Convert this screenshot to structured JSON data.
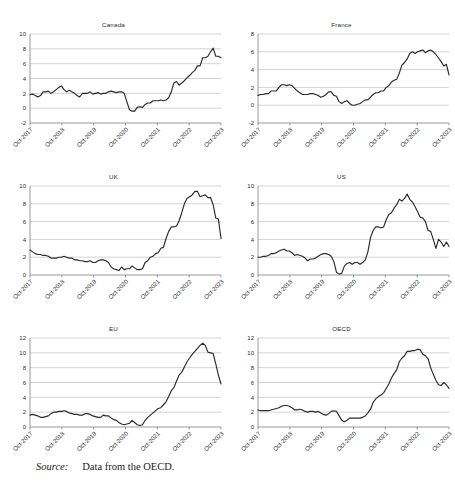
{
  "figure": {
    "source_label": "Source:",
    "source_text": "Data from the OECD."
  },
  "chart_data": [
    {
      "type": "line",
      "title": "Canada",
      "xlabel": "",
      "ylabel": "",
      "grid": true,
      "legend": "none",
      "ylim": [
        -2,
        10
      ],
      "yticks": [
        -2,
        0,
        2,
        4,
        6,
        8,
        10
      ],
      "xticks": [
        "Oct-2017",
        "Oct-2018",
        "Oct-2019",
        "Oct-2020",
        "Oct-2021",
        "Oct-2022",
        "Oct-2023"
      ],
      "x": [
        0,
        1,
        2,
        3,
        4,
        5,
        6,
        7,
        8,
        9,
        10,
        11,
        12,
        13,
        14,
        15,
        16,
        17,
        18,
        19,
        20,
        21,
        22,
        23,
        24,
        25,
        26,
        27,
        28,
        29,
        30,
        31,
        32,
        33,
        34,
        35,
        36,
        37,
        38,
        39,
        40,
        41,
        42,
        43,
        44,
        45,
        46,
        47,
        48,
        49,
        50,
        51,
        52,
        53,
        54,
        55,
        56,
        57,
        58,
        59,
        60,
        61,
        62,
        63,
        64,
        65,
        66,
        67,
        68,
        69,
        70,
        71,
        72,
        73
      ],
      "values": [
        1.8,
        1.9,
        1.7,
        1.5,
        1.7,
        2.2,
        2.2,
        2.3,
        2.0,
        2.2,
        2.5,
        2.8,
        3.0,
        2.5,
        2.2,
        2.4,
        2.2,
        2.0,
        1.7,
        1.5,
        2.0,
        2.0,
        2.0,
        2.2,
        1.9,
        2.0,
        2.1,
        1.9,
        2.0,
        2.0,
        2.2,
        2.3,
        2.2,
        2.1,
        2.2,
        2.2,
        2.0,
        0.9,
        -0.2,
        -0.4,
        -0.4,
        0.1,
        0.2,
        0.1,
        0.5,
        0.7,
        0.7,
        1.0,
        1.0,
        1.0,
        1.1,
        1.0,
        1.1,
        1.4,
        2.2,
        3.4,
        3.6,
        3.1,
        3.4,
        3.7,
        4.1,
        4.4,
        4.8,
        5.1,
        5.7,
        5.7,
        6.8,
        6.8,
        7.0,
        7.6,
        8.1,
        7.0,
        7.0,
        6.8
      ]
    },
    {
      "type": "line",
      "title": "France",
      "xlabel": "",
      "ylabel": "",
      "grid": true,
      "legend": "none",
      "ylim": [
        -2,
        8
      ],
      "yticks": [
        -2,
        0,
        2,
        4,
        6,
        8
      ],
      "xticks": [
        "Oct-2017",
        "Oct-2018",
        "Oct-2019",
        "Oct-2020",
        "Oct-2021",
        "Oct-2022",
        "Oct-2023"
      ],
      "x": [
        0,
        1,
        2,
        3,
        4,
        5,
        6,
        7,
        8,
        9,
        10,
        11,
        12,
        13,
        14,
        15,
        16,
        17,
        18,
        19,
        20,
        21,
        22,
        23,
        24,
        25,
        26,
        27,
        28,
        29,
        30,
        31,
        32,
        33,
        34,
        35,
        36,
        37,
        38,
        39,
        40,
        41,
        42,
        43,
        44,
        45,
        46,
        47,
        48,
        49,
        50,
        51,
        52,
        53,
        54,
        55,
        56,
        57,
        58,
        59,
        60,
        61,
        62,
        63,
        64,
        65,
        66,
        67,
        68,
        69,
        70,
        71,
        72,
        73
      ],
      "values": [
        1.1,
        1.2,
        1.2,
        1.3,
        1.3,
        1.6,
        1.6,
        1.6,
        2.0,
        2.3,
        2.3,
        2.2,
        2.3,
        2.2,
        1.9,
        1.6,
        1.4,
        1.2,
        1.2,
        1.2,
        1.3,
        1.3,
        1.2,
        1.1,
        0.9,
        1.0,
        1.2,
        1.5,
        1.5,
        1.1,
        1.0,
        0.4,
        0.2,
        0.4,
        0.5,
        0.2,
        0.0,
        0.0,
        0.1,
        0.2,
        0.4,
        0.6,
        0.6,
        0.9,
        1.2,
        1.4,
        1.4,
        1.6,
        1.6,
        2.0,
        2.2,
        2.6,
        2.8,
        2.9,
        3.6,
        4.5,
        4.8,
        5.2,
        5.8,
        6.0,
        5.8,
        6.0,
        6.1,
        6.2,
        5.9,
        6.1,
        6.2,
        6.0,
        5.7,
        5.3,
        4.9,
        4.4,
        4.6,
        3.4
      ]
    },
    {
      "type": "line",
      "title": "UK",
      "xlabel": "",
      "ylabel": "",
      "grid": true,
      "legend": "none",
      "ylim": [
        0,
        10
      ],
      "yticks": [
        0,
        2,
        4,
        6,
        8,
        10
      ],
      "xticks": [
        "Oct-2017",
        "Oct-2018",
        "Oct-2019",
        "Oct-2020",
        "Oct-2021",
        "Oct-2022",
        "Oct-2023"
      ],
      "x": [
        0,
        1,
        2,
        3,
        4,
        5,
        6,
        7,
        8,
        9,
        10,
        11,
        12,
        13,
        14,
        15,
        16,
        17,
        18,
        19,
        20,
        21,
        22,
        23,
        24,
        25,
        26,
        27,
        28,
        29,
        30,
        31,
        32,
        33,
        34,
        35,
        36,
        37,
        38,
        39,
        40,
        41,
        42,
        43,
        44,
        45,
        46,
        47,
        48,
        49,
        50,
        51,
        52,
        53,
        54,
        55,
        56,
        57,
        58,
        59,
        60,
        61,
        62,
        63,
        64,
        65,
        66,
        67,
        68,
        69,
        70,
        71,
        72,
        73
      ],
      "values": [
        2.8,
        2.6,
        2.4,
        2.3,
        2.3,
        2.2,
        2.2,
        2.1,
        1.9,
        1.9,
        1.9,
        2.0,
        2.0,
        2.1,
        2.0,
        1.9,
        1.9,
        1.7,
        1.7,
        1.6,
        1.6,
        1.5,
        1.5,
        1.6,
        1.4,
        1.4,
        1.6,
        1.7,
        1.7,
        1.6,
        1.4,
        0.9,
        0.7,
        0.6,
        0.5,
        0.9,
        0.6,
        0.7,
        0.7,
        1.0,
        0.8,
        0.6,
        0.6,
        0.7,
        1.4,
        1.6,
        2.0,
        2.1,
        2.4,
        2.5,
        3.0,
        3.1,
        4.1,
        4.9,
        5.4,
        5.4,
        5.5,
        6.1,
        7.0,
        8.0,
        8.6,
        8.8,
        9.0,
        9.4,
        9.4,
        8.8,
        8.9,
        9.0,
        8.7,
        8.7,
        7.9,
        6.4,
        6.3,
        4.1
      ]
    },
    {
      "type": "line",
      "title": "US",
      "xlabel": "",
      "ylabel": "",
      "grid": true,
      "legend": "none",
      "ylim": [
        0,
        10
      ],
      "yticks": [
        0,
        2,
        4,
        6,
        8,
        10
      ],
      "xticks": [
        "Oct-2017",
        "Oct-2018",
        "Oct-2019",
        "Oct-2020",
        "Oct-2021",
        "Oct-2022",
        "Oct-2023"
      ],
      "x": [
        0,
        1,
        2,
        3,
        4,
        5,
        6,
        7,
        8,
        9,
        10,
        11,
        12,
        13,
        14,
        15,
        16,
        17,
        18,
        19,
        20,
        21,
        22,
        23,
        24,
        25,
        26,
        27,
        28,
        29,
        30,
        31,
        32,
        33,
        34,
        35,
        36,
        37,
        38,
        39,
        40,
        41,
        42,
        43,
        44,
        45,
        46,
        47,
        48,
        49,
        50,
        51,
        52,
        53,
        54,
        55,
        56,
        57,
        58,
        59,
        60,
        61,
        62,
        63,
        64,
        65,
        66,
        67,
        68,
        69,
        70,
        71,
        72,
        73
      ],
      "values": [
        2.0,
        2.0,
        2.1,
        2.1,
        2.2,
        2.4,
        2.4,
        2.5,
        2.7,
        2.8,
        2.9,
        2.7,
        2.7,
        2.5,
        2.2,
        2.3,
        2.2,
        2.1,
        1.9,
        1.6,
        1.8,
        1.8,
        1.9,
        2.1,
        2.3,
        2.4,
        2.4,
        2.3,
        2.1,
        1.5,
        0.3,
        0.1,
        0.2,
        1.0,
        1.3,
        1.4,
        1.2,
        1.4,
        1.4,
        1.2,
        1.4,
        1.7,
        2.6,
        4.2,
        5.0,
        5.4,
        5.4,
        5.3,
        5.4,
        6.2,
        6.8,
        7.0,
        7.5,
        7.9,
        8.5,
        8.3,
        8.6,
        9.1,
        8.5,
        8.2,
        7.7,
        7.1,
        6.5,
        6.4,
        6.0,
        5.0,
        4.9,
        4.0,
        3.0,
        4.0,
        3.7,
        3.2,
        3.7,
        3.2
      ]
    },
    {
      "type": "line",
      "title": "EU",
      "xlabel": "",
      "ylabel": "",
      "grid": true,
      "legend": "none",
      "ylim": [
        0,
        12
      ],
      "yticks": [
        0,
        2,
        4,
        6,
        8,
        10,
        12
      ],
      "xticks": [
        "Oct-2017",
        "Oct-2018",
        "Oct-2019",
        "Oct-2020",
        "Oct-2021",
        "Oct-2022",
        "Oct-2023"
      ],
      "x": [
        0,
        1,
        2,
        3,
        4,
        5,
        6,
        7,
        8,
        9,
        10,
        11,
        12,
        13,
        14,
        15,
        16,
        17,
        18,
        19,
        20,
        21,
        22,
        23,
        24,
        25,
        26,
        27,
        28,
        29,
        30,
        31,
        32,
        33,
        34,
        35,
        36,
        37,
        38,
        39,
        40,
        41,
        42,
        43,
        44,
        45,
        46,
        47,
        48,
        49,
        50,
        51,
        52,
        53,
        54,
        55,
        56,
        57,
        58,
        59,
        60,
        61,
        62,
        63,
        64,
        65,
        66,
        67,
        68,
        69,
        70,
        71,
        72,
        73
      ],
      "values": [
        1.6,
        1.7,
        1.6,
        1.5,
        1.3,
        1.3,
        1.4,
        1.5,
        1.8,
        2.0,
        2.0,
        2.1,
        2.1,
        2.2,
        2.1,
        1.9,
        1.8,
        1.7,
        1.7,
        1.6,
        1.6,
        1.8,
        1.8,
        1.7,
        1.5,
        1.4,
        1.3,
        1.3,
        1.6,
        1.5,
        1.5,
        1.2,
        1.0,
        0.9,
        0.6,
        0.4,
        0.3,
        0.4,
        0.5,
        0.9,
        0.6,
        0.3,
        0.2,
        0.3,
        0.9,
        1.3,
        1.6,
        1.9,
        2.2,
        2.5,
        2.6,
        3.0,
        3.4,
        4.1,
        4.9,
        5.3,
        6.2,
        7.0,
        7.4,
        8.1,
        8.8,
        9.3,
        9.8,
        10.2,
        10.6,
        11.0,
        11.3,
        11.0,
        10.1,
        10.0,
        9.9,
        8.5,
        7.0,
        5.8
      ]
    },
    {
      "type": "line",
      "title": "OECD",
      "xlabel": "",
      "ylabel": "",
      "grid": true,
      "legend": "none",
      "ylim": [
        0,
        12
      ],
      "yticks": [
        0,
        2,
        4,
        6,
        8,
        10,
        12
      ],
      "xticks": [
        "Oct-2017",
        "Oct-2018",
        "Oct-2019",
        "Oct-2020",
        "Oct-2021",
        "Oct-2022",
        "Oct-2023"
      ],
      "x": [
        0,
        1,
        2,
        3,
        4,
        5,
        6,
        7,
        8,
        9,
        10,
        11,
        12,
        13,
        14,
        15,
        16,
        17,
        18,
        19,
        20,
        21,
        22,
        23,
        24,
        25,
        26,
        27,
        28,
        29,
        30,
        31,
        32,
        33,
        34,
        35,
        36,
        37,
        38,
        39,
        40,
        41,
        42,
        43,
        44,
        45,
        46,
        47,
        48,
        49,
        50,
        51,
        52,
        53,
        54,
        55,
        56,
        57,
        58,
        59,
        60,
        61,
        62,
        63,
        64,
        65,
        66,
        67,
        68,
        69,
        70,
        71,
        72,
        73
      ],
      "values": [
        2.3,
        2.2,
        2.2,
        2.2,
        2.2,
        2.3,
        2.4,
        2.5,
        2.6,
        2.8,
        2.9,
        2.9,
        2.8,
        2.6,
        2.3,
        2.3,
        2.4,
        2.3,
        2.1,
        2.0,
        2.1,
        2.1,
        2.0,
        2.1,
        1.9,
        1.7,
        1.6,
        1.8,
        2.1,
        2.2,
        2.1,
        1.5,
        0.9,
        0.7,
        0.9,
        1.2,
        1.2,
        1.2,
        1.2,
        1.2,
        1.3,
        1.5,
        1.9,
        2.4,
        3.3,
        3.8,
        4.1,
        4.3,
        4.6,
        5.2,
        5.8,
        6.6,
        7.2,
        7.7,
        8.8,
        9.3,
        9.6,
        10.2,
        10.2,
        10.3,
        10.3,
        10.5,
        10.4,
        9.8,
        9.6,
        9.2,
        8.0,
        7.1,
        6.3,
        5.7,
        5.6,
        6.0,
        5.7,
        5.2
      ]
    }
  ]
}
